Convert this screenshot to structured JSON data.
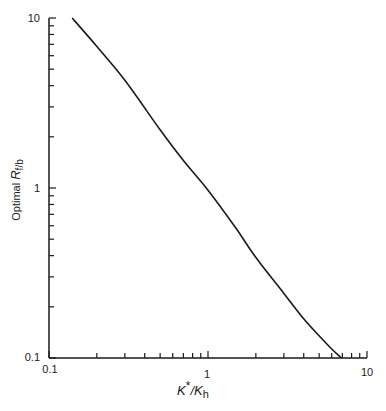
{
  "chart_data": {
    "type": "line",
    "title": "",
    "xlabel": "K*/Kh",
    "ylabel": "Optimal Rf/b",
    "xscale": "log",
    "yscale": "log",
    "xlim": [
      0.1,
      10
    ],
    "ylim": [
      0.1,
      10
    ],
    "grid": false,
    "legend": null,
    "x_ticks": [
      "0.1",
      "1",
      "10"
    ],
    "y_ticks": [
      "0.1",
      "1",
      "10"
    ],
    "series": [
      {
        "name": "Optimal Rf/b",
        "color": "#1a1a1a",
        "x": [
          0.14,
          0.2,
          0.3,
          0.5,
          0.7,
          1.0,
          1.5,
          2.0,
          3.0,
          4.0,
          5.0,
          6.0,
          6.9
        ],
        "y": [
          10.0,
          6.8,
          4.3,
          2.2,
          1.45,
          0.97,
          0.58,
          0.39,
          0.24,
          0.17,
          0.135,
          0.113,
          0.1
        ]
      }
    ]
  },
  "labels": {
    "x_title_main": "K",
    "x_title_sup": "*",
    "x_title_sep": "/K",
    "x_title_sub": "h",
    "y_title_plain": "Optimal ",
    "y_title_main": "R",
    "y_title_sub": "f/b",
    "x_tick_01": "0.1",
    "x_tick_1": "1",
    "x_tick_10": "10",
    "y_tick_01": "0.1",
    "y_tick_1": "1",
    "y_tick_10": "10"
  }
}
